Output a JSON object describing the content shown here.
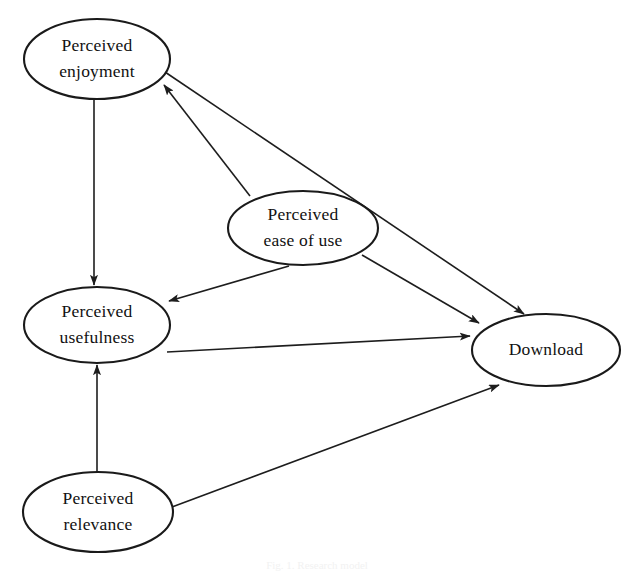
{
  "diagram": {
    "type": "research-model-path-diagram",
    "background_color": "#ffffff",
    "stroke_color": "#1a1a1a",
    "text_color": "#111111",
    "nodes": [
      {
        "id": "perceived-enjoyment",
        "line1": "Perceived",
        "line2": "enjoyment",
        "cx": 97,
        "cy": 59,
        "rx": 73,
        "ry": 40
      },
      {
        "id": "perceived-ease-of-use",
        "line1": "Perceived",
        "line2": "ease of use",
        "cx": 303,
        "cy": 228,
        "rx": 75,
        "ry": 37
      },
      {
        "id": "perceived-usefulness",
        "line1": "Perceived",
        "line2": "usefulness",
        "cx": 97,
        "cy": 325,
        "rx": 73,
        "ry": 38
      },
      {
        "id": "download",
        "line1": "Download",
        "line2": "",
        "cx": 546,
        "cy": 350,
        "rx": 74,
        "ry": 36
      },
      {
        "id": "perceived-relevance",
        "line1": "Perceived",
        "line2": "relevance",
        "cx": 98,
        "cy": 512,
        "rx": 75,
        "ry": 40
      }
    ],
    "edges": [
      {
        "id": "enjoyment-to-usefulness",
        "from": "perceived-enjoyment",
        "to": "perceived-usefulness",
        "x1": 94,
        "y1": 100,
        "x2": 94,
        "y2": 285,
        "arrow": true
      },
      {
        "id": "enjoyment-to-download",
        "from": "perceived-enjoyment",
        "to": "download",
        "x1": 165,
        "y1": 72,
        "x2": 524,
        "y2": 314,
        "arrow": true
      },
      {
        "id": "ease-of-use-to-enjoyment",
        "from": "perceived-ease-of-use",
        "to": "perceived-enjoyment",
        "x1": 250,
        "y1": 196,
        "x2": 164,
        "y2": 85,
        "arrow": true
      },
      {
        "id": "ease-of-use-to-usefulness",
        "from": "perceived-ease-of-use",
        "to": "perceived-usefulness",
        "x1": 289,
        "y1": 266,
        "x2": 169,
        "y2": 301,
        "arrow": true
      },
      {
        "id": "ease-of-use-to-download",
        "from": "perceived-ease-of-use",
        "to": "download",
        "x1": 362,
        "y1": 255,
        "x2": 479,
        "y2": 323,
        "arrow": true
      },
      {
        "id": "usefulness-to-download",
        "from": "perceived-usefulness",
        "to": "download",
        "x1": 167,
        "y1": 352,
        "x2": 470,
        "y2": 336,
        "arrow": true
      },
      {
        "id": "relevance-to-usefulness",
        "from": "perceived-relevance",
        "to": "perceived-usefulness",
        "x1": 97,
        "y1": 473,
        "x2": 97,
        "y2": 365,
        "arrow": true
      },
      {
        "id": "relevance-to-download",
        "from": "perceived-relevance",
        "to": "download",
        "x1": 172,
        "y1": 507,
        "x2": 499,
        "y2": 385,
        "arrow": true
      }
    ],
    "caption": "Fig. 1. Research model"
  }
}
